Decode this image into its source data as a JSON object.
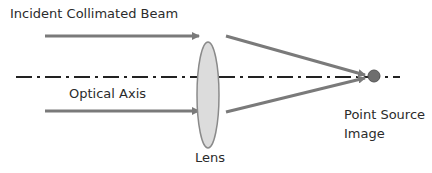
{
  "labels": {
    "incident_beam": "Incident Collimated Beam",
    "optical_axis": "Optical Axis",
    "lens": "Lens",
    "point_source_line1": "Point Source",
    "point_source_line2": "Image"
  },
  "colors": {
    "ray": "#7a7a7a",
    "lens_fill": "#dcdcdc",
    "lens_stroke": "#8a8a8a",
    "axis": "#222222",
    "point": "#6e6e6e",
    "text": "#2b2b2b"
  }
}
